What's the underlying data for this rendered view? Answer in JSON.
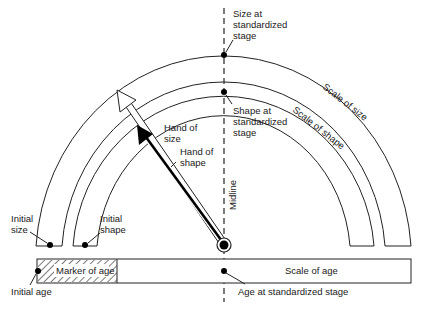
{
  "diagram": {
    "labels": {
      "size_standard": [
        "Size at",
        "standardized",
        "stage"
      ],
      "shape_standard": [
        "Shape at",
        "standardized",
        "stage"
      ],
      "scale_size": "Scale of size",
      "scale_shape": "Scale of shape",
      "hand_size": [
        "Hand of",
        "size"
      ],
      "hand_shape": [
        "Hand of",
        "shape"
      ],
      "midline": "Midline",
      "initial_size": [
        "Initial",
        "size"
      ],
      "initial_shape": [
        "Initial",
        "shape"
      ],
      "marker_age": "Marker of age",
      "scale_age": "Scale of age",
      "initial_age": "Initial age",
      "age_standard": "Age at standardized stage"
    },
    "colors": {
      "line": "#222222",
      "background": "#ffffff",
      "hand_shape": "#000000"
    }
  }
}
